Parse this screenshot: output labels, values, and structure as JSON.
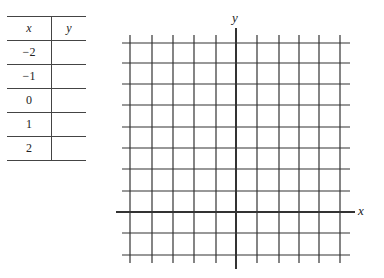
{
  "table": {
    "headers": {
      "x": "x",
      "y": "y"
    },
    "rows": [
      {
        "x": "−2",
        "y": ""
      },
      {
        "x": "−1",
        "y": ""
      },
      {
        "x": "0",
        "y": ""
      },
      {
        "x": "1",
        "y": ""
      },
      {
        "x": "2",
        "y": ""
      }
    ]
  },
  "graph": {
    "x_axis_label": "x",
    "y_axis_label": "y",
    "vertical_lines_x": [
      130,
      152,
      173,
      194,
      216,
      257,
      279,
      299,
      319,
      340
    ],
    "horizontal_lines_y": [
      43,
      63,
      84,
      105,
      127,
      148,
      169,
      191,
      233,
      255
    ],
    "x_axis_y": 212,
    "y_axis_x": 236
  }
}
